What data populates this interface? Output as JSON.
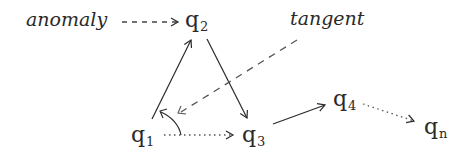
{
  "diagram": {
    "labels": {
      "anomaly": "anomaly",
      "tangent": "tangent"
    },
    "nodes": [
      {
        "id": "q1",
        "base": "q",
        "sub": "1"
      },
      {
        "id": "q2",
        "base": "q",
        "sub": "2"
      },
      {
        "id": "q3",
        "base": "q",
        "sub": "3"
      },
      {
        "id": "q4",
        "base": "q",
        "sub": "4"
      },
      {
        "id": "qn",
        "base": "q",
        "sub": "n"
      }
    ],
    "edges": [
      {
        "from": "anomaly",
        "to": "q2",
        "style": "dashed"
      },
      {
        "from": "q1",
        "to": "q2",
        "style": "solid"
      },
      {
        "from": "q2",
        "to": "q3",
        "style": "solid"
      },
      {
        "from": "q1",
        "to": "q3",
        "style": "dotted"
      },
      {
        "from": "q3",
        "to": "q4",
        "style": "solid"
      },
      {
        "from": "q4",
        "to": "qn",
        "style": "dotted"
      },
      {
        "from": "tangent",
        "to": "angle-at-q1",
        "style": "dashed"
      }
    ],
    "annotations": [
      {
        "type": "angle-arc",
        "at": "q1",
        "between": [
          "q1-q2",
          "q1-q3"
        ]
      }
    ],
    "colors": {
      "ink": "#2a2a2a",
      "dashed": "#555555",
      "background": "#ffffff"
    }
  }
}
